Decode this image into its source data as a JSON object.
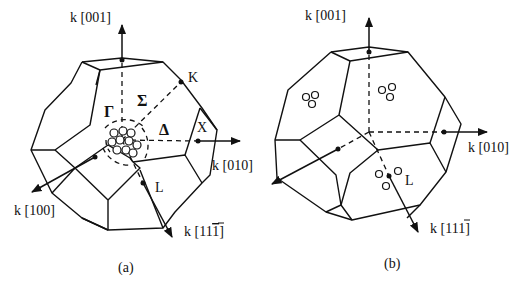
{
  "figure": {
    "panels": [
      {
        "id": "a",
        "caption": "(a)",
        "axes": {
          "k001": "k [001]",
          "k010": "k [010]",
          "k100": "k [100]",
          "k111bar": "k [11",
          "k111bar_last": "1",
          "k111bar_close": "]"
        },
        "symmetry_labels": {
          "gamma": "Γ",
          "sigma": "Σ",
          "delta": "Δ",
          "K": "K",
          "X": "X",
          "L": "L"
        }
      },
      {
        "id": "b",
        "caption": "(b)",
        "axes": {
          "k001": "k [001]",
          "k010": "k [010]",
          "k111bar": "k [11",
          "k111bar_last": "1",
          "k111bar_close": "]"
        },
        "symmetry_labels": {
          "L": "L"
        }
      }
    ]
  }
}
